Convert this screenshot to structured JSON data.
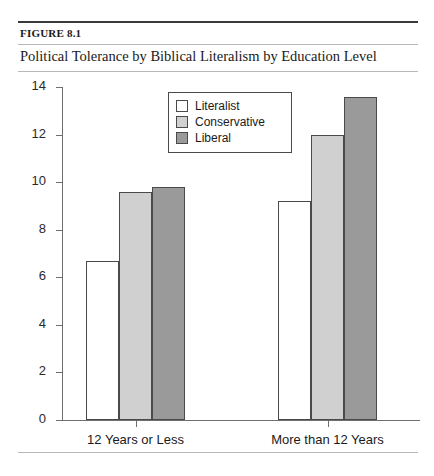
{
  "header": {
    "figure_label": "FIGURE 8.1",
    "title": "Political Tolerance by Biblical Literalism by Education Level"
  },
  "legend": {
    "items": [
      {
        "label": "Literalist",
        "color": "#ffffff"
      },
      {
        "label": "Conservative",
        "color": "#d0d0d0"
      },
      {
        "label": "Liberal",
        "color": "#9a9a9a"
      }
    ]
  },
  "axis": {
    "y_ticks": [
      "0",
      "2",
      "4",
      "6",
      "8",
      "10",
      "12",
      "14"
    ],
    "x_ticks": [
      "12 Years or Less",
      "More than 12 Years"
    ]
  },
  "chart_data": {
    "type": "bar",
    "title": "Political Tolerance by Biblical Literalism by Education Level",
    "xlabel": "",
    "ylabel": "",
    "ylim": [
      0,
      14
    ],
    "ytick_step": 2,
    "grid": false,
    "legend_position": "upper-center-left",
    "categories": [
      "12 Years or Less",
      "More than 12 Years"
    ],
    "series": [
      {
        "name": "Literalist",
        "color": "#ffffff",
        "values": [
          6.7,
          9.2
        ]
      },
      {
        "name": "Conservative",
        "color": "#d0d0d0",
        "values": [
          9.6,
          12.0
        ]
      },
      {
        "name": "Liberal",
        "color": "#9a9a9a",
        "values": [
          9.8,
          13.6
        ]
      }
    ]
  }
}
